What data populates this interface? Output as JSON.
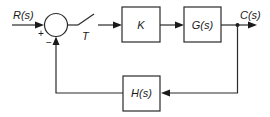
{
  "diagram": {
    "type": "block-diagram",
    "input": {
      "label": "R(s)"
    },
    "output": {
      "label": "C(s)"
    },
    "summing_junction": {
      "plus_sign": "+",
      "minus_sign": "−"
    },
    "sampler": {
      "label": "T"
    },
    "blocks": [
      {
        "id": "gain",
        "label": "K"
      },
      {
        "id": "plant",
        "label": "G(s)"
      },
      {
        "id": "feedback",
        "label": "H(s)"
      }
    ],
    "connections": [
      {
        "from": "R(s)",
        "to": "summing_junction",
        "sign": "+"
      },
      {
        "from": "summing_junction",
        "to": "sampler"
      },
      {
        "from": "sampler",
        "to": "K"
      },
      {
        "from": "K",
        "to": "G(s)"
      },
      {
        "from": "G(s)",
        "to": "C(s)"
      },
      {
        "from": "C(s)",
        "to": "H(s)"
      },
      {
        "from": "H(s)",
        "to": "summing_junction",
        "sign": "-"
      }
    ],
    "colors": {
      "stroke": "#2a2a2a",
      "background": "#ffffff"
    }
  }
}
